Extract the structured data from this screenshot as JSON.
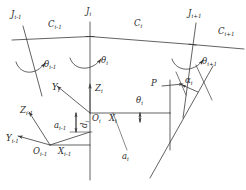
{
  "figure": {
    "type": "kinematic-linkage-diagram",
    "stroke_color": "#3a3a3a",
    "text_color": "#2b2b2b",
    "background_color": "#ffffff",
    "width": 246,
    "height": 190
  },
  "labels": {
    "joint_prev": {
      "base": "J",
      "sub": "i-1"
    },
    "joint_cur": {
      "base": "J",
      "sub": "i"
    },
    "joint_next": {
      "base": "J",
      "sub": "i+1"
    },
    "link_prev": {
      "base": "C",
      "sub": "i-1"
    },
    "link_cur": {
      "base": "C",
      "sub": "i"
    },
    "link_next": {
      "base": "C",
      "sub": "i+1"
    },
    "theta_prev": {
      "base": "θ",
      "sub": "i-1"
    },
    "theta_cur": {
      "base": "θ",
      "sub": "i"
    },
    "theta_next": {
      "base": "θ",
      "sub": "i+1"
    },
    "theta_cur_mid": {
      "base": "θ",
      "sub": "i"
    },
    "alpha_cur": {
      "base": "α",
      "sub": "i"
    },
    "a_prev": {
      "base": "a",
      "sub": "i-1"
    },
    "a_cur": {
      "base": "a",
      "sub": "i"
    },
    "d_cur": {
      "base": "d",
      "sub": "i"
    },
    "origin_prev": {
      "base": "O",
      "sub": "i-1"
    },
    "origin_cur": {
      "base": "O",
      "sub": "i"
    },
    "x_prev": {
      "base": "X",
      "sub": "i-1"
    },
    "x_cur": {
      "base": "X",
      "sub": "i"
    },
    "y_prev": {
      "base": "Y",
      "sub": "i-1"
    },
    "y_cur": {
      "base": "Y",
      "sub": "i"
    },
    "z_prev": {
      "base": "Z",
      "sub": "i-1"
    },
    "z_cur": {
      "base": "Z",
      "sub": "i"
    },
    "point_p": {
      "base": "P",
      "sub": ""
    }
  }
}
